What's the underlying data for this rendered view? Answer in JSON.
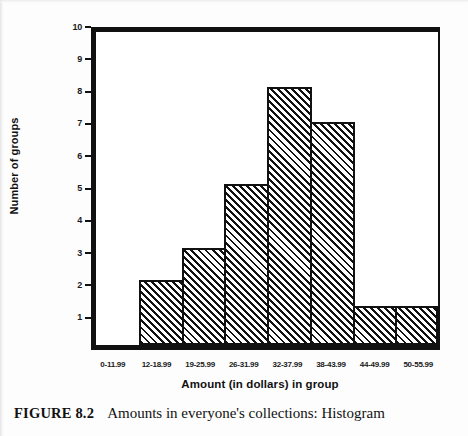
{
  "figure": {
    "label": "FIGURE 8.2",
    "caption": "Amounts in everyone's collections: Histogram"
  },
  "chart_data": {
    "type": "bar",
    "title": "",
    "subtitle": "",
    "xlabel": "Amount (in dollars) in group",
    "ylabel": "Number of groups",
    "categories": [
      "0-11.99",
      "12-18.99",
      "19-25.99",
      "26-31.99",
      "32-37.99",
      "38-43.99",
      "44-49.99",
      "50-55.99"
    ],
    "values": [
      0,
      2,
      3,
      5,
      8,
      6.9,
      1.2,
      1.2
    ],
    "ylim": [
      0,
      10
    ],
    "ytick_labels": [
      "1",
      "2",
      "3",
      "4",
      "5",
      "6",
      "7",
      "8",
      "9",
      "10"
    ],
    "ytick_values": [
      1,
      2,
      3,
      4,
      5,
      6,
      7,
      8,
      9,
      10
    ],
    "grid": false,
    "legend": null,
    "bar_fill": "diagonal-hatch",
    "colors": {
      "line": "#111111",
      "fill": "#ffffff",
      "hatch": "#111111",
      "page_background": "#fdfdfd",
      "plot_background": "#ffffff"
    }
  }
}
